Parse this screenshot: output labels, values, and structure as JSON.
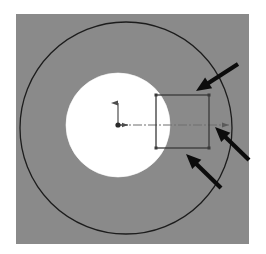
{
  "figure": {
    "name": "annular-cross-section-with-rectangular-element",
    "caption": "",
    "canvas": {
      "width": 266,
      "height": 254,
      "background": "#ffffff"
    }
  },
  "panel": {
    "name": "gray-background-panel",
    "x": 16,
    "y": 14,
    "width": 233,
    "height": 230,
    "fill": "#8a8a8a",
    "stroke": "none"
  },
  "shapes": {
    "outer_circle": {
      "label": "outer-circle",
      "cx": 126,
      "cy": 128,
      "r": 106,
      "fill": "#8a8a8a",
      "stroke": "#1c1c1c",
      "stroke_width": 1.3
    },
    "inner_circle": {
      "label": "inner-circle",
      "cx": 118,
      "cy": 125,
      "r": 52,
      "fill": "#ffffff",
      "stroke": "#ffffff",
      "stroke_width": 0.6
    },
    "rectangle": {
      "label": "rectangular-element",
      "x": 156,
      "y": 95,
      "width": 53,
      "height": 53,
      "fill": "none",
      "stroke": "#3a3a3a",
      "stroke_width": 1.3,
      "corner_node_size": 3,
      "corner_node_fill": "#3a3a3a"
    }
  },
  "axes": {
    "origin": {
      "label": "origin-point",
      "x": 118,
      "y": 125,
      "dot_radius": 2.6,
      "color": "#2a2a2a"
    },
    "y_axis": {
      "label": "y-axis-arrow",
      "x1": 118,
      "y1": 125,
      "x2": 118,
      "y2": 101,
      "color": "#4d4d4d",
      "stroke_width": 1.2,
      "arrow": "up"
    },
    "x_axis_stub": {
      "label": "x-axis-arrow",
      "x1": 118,
      "y1": 125,
      "x2": 131,
      "y2": 125,
      "color": "#4d4d4d",
      "stroke_width": 1.2,
      "arrow": "right"
    },
    "centerline": {
      "label": "horizontal-centerline",
      "x1": 118,
      "y1": 125,
      "x2": 233,
      "y2": 125,
      "color": "#6e6e6e",
      "stroke_width": 1.1,
      "dash_pattern": "9 2 2 2",
      "end_marker": "arrow-right"
    }
  },
  "annotations": {
    "arrows": [
      {
        "name": "annotation-arrow-top-right",
        "from": {
          "x": 238,
          "y": 64
        },
        "to": {
          "x": 196,
          "y": 91
        },
        "color": "#0c0c0c",
        "shaft_width": 4.2,
        "head_length": 15,
        "head_width": 13
      },
      {
        "name": "annotation-arrow-right",
        "from": {
          "x": 249,
          "y": 160
        },
        "to": {
          "x": 215,
          "y": 127
        },
        "color": "#0c0c0c",
        "shaft_width": 4.2,
        "head_length": 15,
        "head_width": 13
      },
      {
        "name": "annotation-arrow-bottom",
        "from": {
          "x": 221,
          "y": 188
        },
        "to": {
          "x": 186,
          "y": 154
        },
        "color": "#0c0c0c",
        "shaft_width": 4.2,
        "head_length": 15,
        "head_width": 13
      }
    ]
  },
  "colors": {
    "panel_gray": "#8a8a8a",
    "outline_black": "#1c1c1c",
    "arrow_black": "#0c0c0c",
    "rect_gray": "#3a3a3a",
    "axis_gray": "#4d4d4d",
    "centerline_gray": "#6e6e6e",
    "white": "#ffffff"
  }
}
